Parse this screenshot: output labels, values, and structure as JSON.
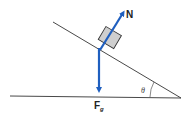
{
  "diagram": {
    "labels": {
      "normal_force": "N",
      "gravity_force": "F",
      "gravity_subscript": "g",
      "angle": "θ"
    },
    "colors": {
      "arrow": "#1f5fbf",
      "block_fill": "#cfcfcf",
      "block_stroke": "#333333",
      "line": "#333333"
    }
  }
}
